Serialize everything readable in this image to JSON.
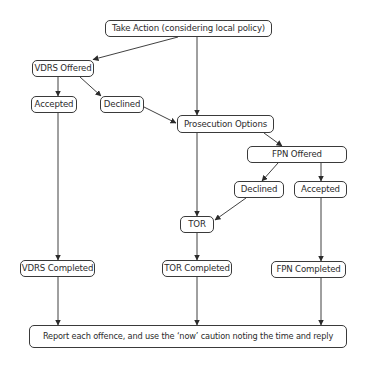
{
  "diagram": {
    "type": "flowchart",
    "nodes": {
      "take_action": "Take Action (considering local policy)",
      "vdrs_offered": "VDRS Offered",
      "vdrs_accepted": "Accepted",
      "vdrs_declined": "Declined",
      "prosecution_options": "Prosecution Options",
      "fpn_offered": "FPN Offered",
      "fpn_declined": "Declined",
      "fpn_accepted": "Accepted",
      "tor": "TOR",
      "vdrs_completed": "VDRS Completed",
      "tor_completed": "TOR Completed",
      "fpn_completed": "FPN Completed",
      "report": "Report each offence, and use the ‘now’ caution noting the time and reply"
    },
    "edges": [
      {
        "from": "take_action",
        "to": "vdrs_offered"
      },
      {
        "from": "take_action",
        "to": "prosecution_options"
      },
      {
        "from": "vdrs_offered",
        "to": "vdrs_accepted"
      },
      {
        "from": "vdrs_offered",
        "to": "vdrs_declined"
      },
      {
        "from": "vdrs_declined",
        "to": "prosecution_options"
      },
      {
        "from": "prosecution_options",
        "to": "fpn_offered"
      },
      {
        "from": "prosecution_options",
        "to": "tor"
      },
      {
        "from": "fpn_offered",
        "to": "fpn_declined"
      },
      {
        "from": "fpn_offered",
        "to": "fpn_accepted"
      },
      {
        "from": "fpn_declined",
        "to": "tor"
      },
      {
        "from": "vdrs_accepted",
        "to": "vdrs_completed"
      },
      {
        "from": "tor",
        "to": "tor_completed"
      },
      {
        "from": "fpn_accepted",
        "to": "fpn_completed"
      },
      {
        "from": "vdrs_completed",
        "to": "report"
      },
      {
        "from": "tor_completed",
        "to": "report"
      },
      {
        "from": "fpn_completed",
        "to": "report"
      }
    ],
    "colors": {
      "line": "#2b2b2b",
      "border": "#3a3a3a",
      "background": "#ffffff"
    }
  }
}
